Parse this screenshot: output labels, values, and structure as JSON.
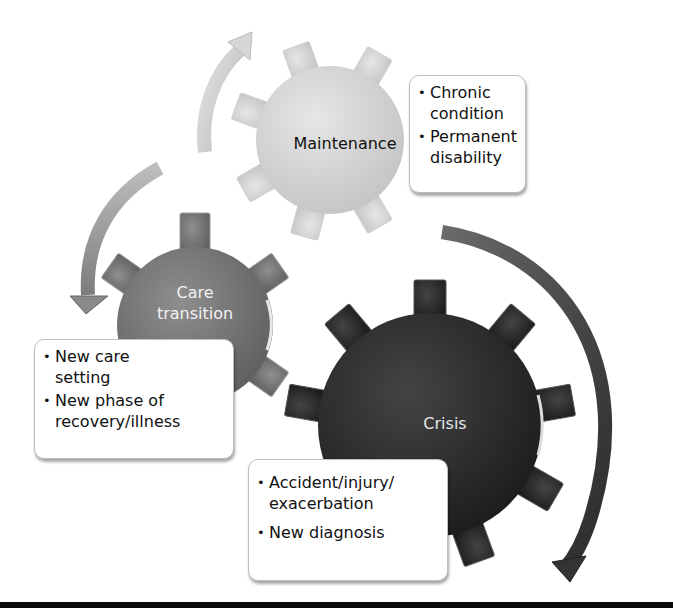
{
  "diagram": {
    "type": "cycle-of-gears",
    "colors": {
      "maintenance_gear": "#d4d4d4",
      "care_transition_gear": "#7a7a7a",
      "crisis_gear": "#2e2e2e",
      "arrow_light": "#cfcfcf",
      "arrow_mid": "#9a9a9a",
      "arrow_dark": "#3a3a3a",
      "bottom_rule": "#0a0a0a"
    },
    "gears": [
      {
        "id": "maintenance",
        "label": "Maintenance",
        "details": [
          "Chronic condition",
          "Permanent disability"
        ]
      },
      {
        "id": "care-transition",
        "label_line1": "Care",
        "label_line2": "transition",
        "details": [
          "New care setting",
          "New phase of recovery/illness"
        ]
      },
      {
        "id": "crisis",
        "label": "Crisis",
        "details": [
          "Accident/injury/ exacerbation",
          "New diagnosis"
        ]
      }
    ],
    "flow": [
      "Crisis",
      "Care transition",
      "Maintenance",
      "Crisis"
    ]
  }
}
